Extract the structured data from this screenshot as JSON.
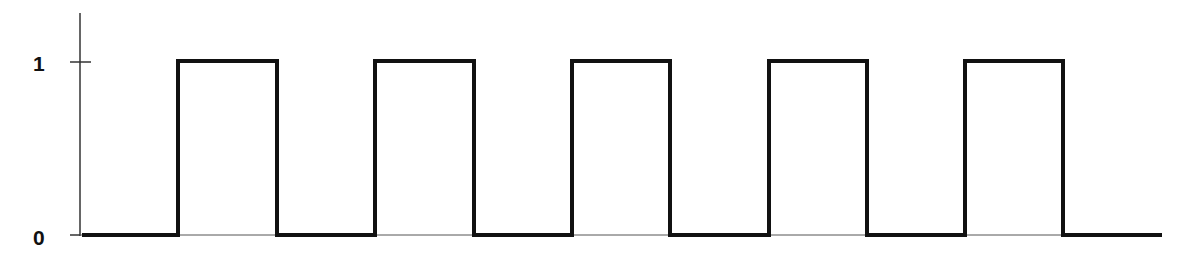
{
  "diagram": {
    "type": "square-wave",
    "y_axis_labels": {
      "high": "1",
      "low": "0"
    },
    "levels": [
      0,
      1
    ],
    "colors": {
      "signal": "#111111",
      "axis": "#333333",
      "background": "#ffffff"
    },
    "geometry": {
      "axis_x": 80,
      "axis_top": 13,
      "high_y": 61,
      "low_y": 235,
      "tick_left": 70,
      "tick_right": 91,
      "start_x": 82,
      "end_x": 1162,
      "edges_x": [
        178,
        277,
        375,
        474,
        572,
        670,
        769,
        867,
        965,
        1063
      ]
    }
  },
  "chart_data": {
    "type": "line",
    "title": "",
    "xlabel": "",
    "ylabel": "",
    "yticks": [
      "0",
      "1"
    ],
    "ylim": [
      0,
      1.3
    ],
    "step": true,
    "x": [
      0,
      1,
      1,
      2,
      2,
      3,
      3,
      4,
      4,
      5,
      5,
      6,
      6,
      7,
      7,
      8,
      8,
      9,
      9,
      10,
      10,
      11
    ],
    "values": [
      0,
      0,
      1,
      1,
      0,
      0,
      1,
      1,
      0,
      0,
      1,
      1,
      0,
      0,
      1,
      1,
      0,
      0,
      1,
      1,
      0,
      0
    ],
    "pulses": 5,
    "duty_cycle": 0.5
  }
}
